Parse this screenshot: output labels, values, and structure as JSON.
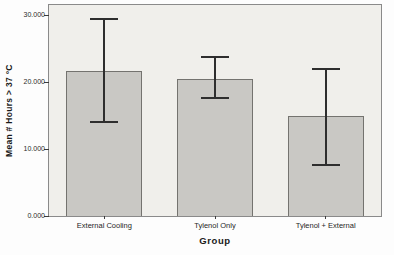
{
  "chart_data": {
    "type": "bar",
    "title": "",
    "categories": [
      "External Cooling",
      "Tylenol Only",
      "Tylenol + External"
    ],
    "values": [
      21.6,
      20.5,
      15.0
    ],
    "error_upper": [
      29.4,
      23.7,
      22.0
    ],
    "error_lower": [
      14.0,
      17.6,
      7.6
    ],
    "xlabel": "Group",
    "ylabel": "Mean # Hours > 37 °C",
    "ylim": [
      0,
      31.5
    ],
    "yticks": [
      0,
      10,
      20,
      30
    ],
    "ytick_labels": [
      "0.000",
      "10.000",
      "20.000",
      "30.000"
    ],
    "grid": false,
    "legend": "none",
    "colors": {
      "bar_fill": "#c9c8c4",
      "bar_border": "#74736f",
      "error_bar": "#2e2e2e",
      "plot_background": "#f0efeb",
      "frame_border": "#8a8a8a",
      "figure_background": "#fdfdfd"
    }
  }
}
